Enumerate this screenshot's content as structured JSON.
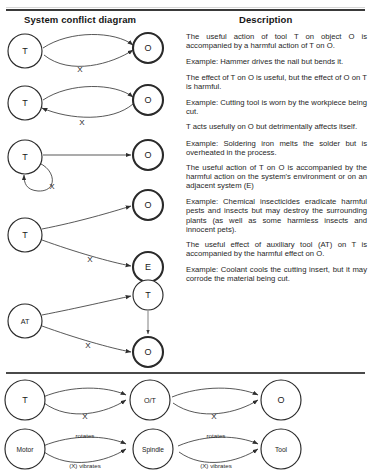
{
  "headers": {
    "diagram_column": "System conflict diagram",
    "description_column": "Description"
  },
  "descriptions": [
    "The useful action of tool T on object O is accompanied by a harmful action of T on O.",
    "Example: Hammer drives the nail but bends it.",
    "The effect of T on O is useful, but the effect of O on T is harmful.",
    "Example: Cutting tool is worn by the workpiece being cut.",
    "T acts usefully on O but detrimentally affects itself.",
    "Example: Soldering iron melts the solder but is overheated in the process.",
    "The useful action of T on O is accompanied by the harmful action on the system's environment or on an adjacent system (E)",
    "Example: Chemical insecticides eradicate harmful pests and insects but may destroy the surrounding plants (as well as some harmless insects and innocent pets).",
    "The useful effect of auxiliary tool (AT) on T is accompanied by the harmful effect on O.",
    "Example: Coolant cools the cutting insert, but it may corrode the material being cut."
  ],
  "diagrams": [
    {
      "id": "conflict-1",
      "nodes": [
        {
          "name": "node-t-left",
          "label": "T"
        },
        {
          "name": "node-o-right",
          "label": "O"
        }
      ],
      "edges": [
        {
          "name": "useful-edge",
          "label": ""
        },
        {
          "name": "harmful-edge",
          "label": "X"
        }
      ]
    },
    {
      "id": "conflict-2",
      "nodes": [
        {
          "name": "node-t-left",
          "label": "T"
        },
        {
          "name": "node-o-right",
          "label": "O"
        }
      ],
      "edges": [
        {
          "name": "useful-edge",
          "label": ""
        },
        {
          "name": "harmful-edge-reverse",
          "label": "X"
        }
      ]
    },
    {
      "id": "conflict-3",
      "nodes": [
        {
          "name": "node-t-left",
          "label": "T"
        },
        {
          "name": "node-o-right",
          "label": "O"
        }
      ],
      "edges": [
        {
          "name": "useful-edge",
          "label": ""
        },
        {
          "name": "harmful-self-loop",
          "label": "X"
        }
      ]
    },
    {
      "id": "conflict-4",
      "nodes": [
        {
          "name": "node-t-left",
          "label": "T"
        },
        {
          "name": "node-o-right",
          "label": "O"
        },
        {
          "name": "node-e-right",
          "label": "E"
        }
      ],
      "edges": [
        {
          "name": "useful-edge",
          "label": ""
        },
        {
          "name": "harmful-edge-env",
          "label": "X"
        }
      ]
    },
    {
      "id": "conflict-5",
      "nodes": [
        {
          "name": "node-at-left",
          "label": "AT"
        },
        {
          "name": "node-t-right",
          "label": "T"
        },
        {
          "name": "node-o-right",
          "label": "O"
        }
      ],
      "edges": [
        {
          "name": "useful-edge",
          "label": ""
        },
        {
          "name": "harmful-edge",
          "label": "X"
        },
        {
          "name": "t-to-o-edge",
          "label": ""
        }
      ]
    }
  ],
  "chain_abstract": {
    "id": "chain-abstract",
    "nodes": [
      {
        "name": "chain-node-t",
        "label": "T"
      },
      {
        "name": "chain-node-ot",
        "label": "O/T"
      },
      {
        "name": "chain-node-o",
        "label": "O"
      }
    ],
    "edges": [
      {
        "name": "chain-useful-1",
        "label": ""
      },
      {
        "name": "chain-harmful-1",
        "label": "X"
      },
      {
        "name": "chain-useful-2",
        "label": ""
      },
      {
        "name": "chain-harmful-2",
        "label": "X"
      }
    ]
  },
  "chain_example": {
    "id": "chain-example",
    "nodes": [
      {
        "name": "chain-node-motor",
        "label": "Motor"
      },
      {
        "name": "chain-node-spindle",
        "label": "Spindle"
      },
      {
        "name": "chain-node-tool",
        "label": "Tool"
      }
    ],
    "edges": [
      {
        "name": "chain-rotates-1",
        "label": "rotates"
      },
      {
        "name": "chain-vibrates-1",
        "label": "(X) vibrates"
      },
      {
        "name": "chain-rotates-2",
        "label": "rotates"
      },
      {
        "name": "chain-vibrates-2",
        "label": "(X) vibrates"
      }
    ]
  },
  "colors": {
    "line": "#3a3a3a",
    "text": "#272727",
    "rule": "#3a3a3a",
    "background": "#ffffff"
  }
}
